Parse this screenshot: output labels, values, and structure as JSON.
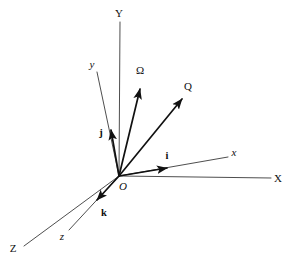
{
  "figure": {
    "background_color": "#ffffff",
    "axis_color": "#3a3a3a",
    "vector_color": "#111111",
    "width": 287,
    "height": 260
  },
  "origin": {
    "label": "O",
    "x": 119,
    "y": 176,
    "label_x": 123,
    "label_y": 186
  },
  "axes": [
    {
      "name": "Y",
      "label": "Y",
      "kind": "fixed-axis",
      "from": [
        119,
        176
      ],
      "to": [
        120,
        22
      ],
      "label_x": 119,
      "label_y": 13
    },
    {
      "name": "X",
      "label": "X",
      "kind": "fixed-axis",
      "from": [
        119,
        176
      ],
      "to": [
        271,
        178
      ],
      "label_x": 278,
      "label_y": 178
    },
    {
      "name": "Z",
      "label": "Z",
      "kind": "fixed-axis",
      "from": [
        119,
        176
      ],
      "to": [
        24,
        246
      ],
      "label_x": 13,
      "label_y": 248
    },
    {
      "name": "y",
      "label": "y",
      "kind": "body-axis",
      "from": [
        119,
        176
      ],
      "to": [
        97,
        72
      ],
      "label_x": 92,
      "label_y": 64
    },
    {
      "name": "x",
      "label": "x",
      "kind": "body-axis",
      "from": [
        119,
        176
      ],
      "to": [
        228,
        157
      ],
      "label_x": 234,
      "label_y": 152
    },
    {
      "name": "z",
      "label": "z",
      "kind": "body-axis",
      "from": [
        119,
        176
      ],
      "to": [
        69,
        230
      ],
      "label_x": 62,
      "label_y": 236
    }
  ],
  "vectors": [
    {
      "name": "omega",
      "label": "Ω",
      "style": "greek",
      "from": [
        119,
        176
      ],
      "to": [
        140,
        86
      ],
      "label_x": 140,
      "label_y": 70
    },
    {
      "name": "Q",
      "label": "Q",
      "style": "cap",
      "from": [
        119,
        176
      ],
      "to": [
        184,
        96
      ],
      "label_x": 188,
      "label_y": 86
    },
    {
      "name": "j",
      "label": "j",
      "style": "unit",
      "from": [
        119,
        176
      ],
      "to": [
        110,
        126
      ],
      "label_x": 101,
      "label_y": 133
    },
    {
      "name": "i",
      "label": "i",
      "style": "unit",
      "from": [
        119,
        176
      ],
      "to": [
        171,
        167
      ],
      "label_x": 167,
      "label_y": 156
    },
    {
      "name": "k",
      "label": "k",
      "style": "unit",
      "from": [
        119,
        176
      ],
      "to": [
        94,
        203
      ],
      "label_x": 104,
      "label_y": 213
    }
  ]
}
